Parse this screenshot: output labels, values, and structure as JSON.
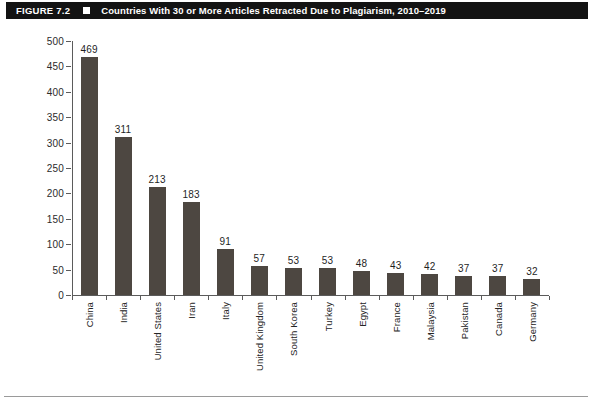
{
  "header": {
    "figure_number": "FIGURE 7.2",
    "marker_icon": "square-bullet-icon",
    "title": "Countries With 30 or More Articles Retracted Due to Plagiarism, 2010–2019"
  },
  "colors": {
    "header_background": "#131313",
    "header_text": "#ffffff",
    "bar_fill": "#4d4741",
    "axis_line": "#5b5b5b",
    "page_background": "#ffffff",
    "rule": "#9a9a9a"
  },
  "chart_data": {
    "type": "bar",
    "title": "Countries With 30 or More Articles Retracted Due to Plagiarism, 2010–2019",
    "xlabel": "",
    "ylabel": "",
    "ylim": [
      0,
      500
    ],
    "yticks": [
      0,
      50,
      100,
      150,
      200,
      250,
      300,
      350,
      400,
      450,
      500
    ],
    "ytick_labels": [
      "0",
      "50",
      "100",
      "150",
      "200",
      "250",
      "300",
      "350",
      "400",
      "450",
      "500"
    ],
    "grid": false,
    "legend": null,
    "data_labels": true,
    "orientation": "vertical",
    "categories": [
      "China",
      "India",
      "United States",
      "Iran",
      "Italy",
      "United Kingdom",
      "South Korea",
      "Turkey",
      "Egypt",
      "France",
      "Malaysia",
      "Pakistan",
      "Canada",
      "Germany"
    ],
    "values": [
      469,
      311,
      213,
      183,
      91,
      57,
      53,
      53,
      48,
      43,
      42,
      37,
      37,
      32
    ],
    "value_labels": [
      "469",
      "311",
      "213",
      "183",
      "91",
      "57",
      "53",
      "53",
      "48",
      "43",
      "42",
      "37",
      "37",
      "32"
    ]
  },
  "footer": {
    "page_artifact": ""
  }
}
